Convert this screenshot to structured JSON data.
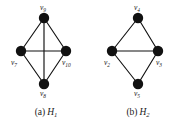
{
  "figure": {
    "background_color": "#ffffff",
    "vertex_color": "#111111",
    "edge_color": "#111111",
    "text_color": "#1a1a1a"
  },
  "panels": [
    {
      "id": "H1",
      "caption_tag": "(a)",
      "caption_name": "H",
      "caption_sub": "1",
      "vertices": [
        {
          "id": "v9",
          "label": "v",
          "sub": "9",
          "x": 44,
          "y": 18,
          "r": 5.2,
          "label_x": 40,
          "label_y": 4,
          "label_anchor": "top"
        },
        {
          "id": "v7",
          "label": "v",
          "sub": "7",
          "x": 21,
          "y": 51,
          "r": 5.2,
          "label_x": 11,
          "label_y": 59,
          "label_anchor": "bottom-left"
        },
        {
          "id": "v10",
          "label": "v",
          "sub": "10",
          "x": 66,
          "y": 51,
          "r": 5.2,
          "label_x": 62,
          "label_y": 59,
          "label_anchor": "bottom-right"
        },
        {
          "id": "v8",
          "label": "v",
          "sub": "8",
          "x": 44,
          "y": 84,
          "r": 5.2,
          "label_x": 40,
          "label_y": 90,
          "label_anchor": "bottom"
        }
      ],
      "edges": [
        {
          "from": "v9",
          "to": "v7",
          "name": "edge-v9-v7"
        },
        {
          "from": "v9",
          "to": "v10",
          "name": "edge-v9-v10"
        },
        {
          "from": "v7",
          "to": "v8",
          "name": "edge-v7-v8"
        },
        {
          "from": "v10",
          "to": "v8",
          "name": "edge-v10-v8"
        },
        {
          "from": "v7",
          "to": "v10",
          "name": "edge-v7-v10"
        },
        {
          "from": "v9",
          "to": "v8",
          "name": "edge-v9-v8"
        }
      ]
    },
    {
      "id": "H2",
      "caption_tag": "(b)",
      "caption_name": "H",
      "caption_sub": "2",
      "vertices": [
        {
          "id": "v4",
          "label": "v",
          "sub": "4",
          "x": 46,
          "y": 18,
          "r": 5.2,
          "label_x": 42,
          "label_y": 4,
          "label_anchor": "top"
        },
        {
          "id": "v2",
          "label": "v",
          "sub": "2",
          "x": 20,
          "y": 51,
          "r": 5.2,
          "label_x": 12,
          "label_y": 59,
          "label_anchor": "bottom-left"
        },
        {
          "id": "v3",
          "label": "v",
          "sub": "3",
          "x": 66,
          "y": 51,
          "r": 5.2,
          "label_x": 64,
          "label_y": 59,
          "label_anchor": "bottom-right"
        },
        {
          "id": "v5",
          "label": "v",
          "sub": "5",
          "x": 46,
          "y": 84,
          "r": 5.2,
          "label_x": 42,
          "label_y": 90,
          "label_anchor": "bottom"
        }
      ],
      "edges": [
        {
          "from": "v4",
          "to": "v2",
          "name": "edge-v4-v2"
        },
        {
          "from": "v4",
          "to": "v3",
          "name": "edge-v4-v3"
        },
        {
          "from": "v2",
          "to": "v5",
          "name": "edge-v2-v5"
        },
        {
          "from": "v3",
          "to": "v5",
          "name": "edge-v3-v5"
        },
        {
          "from": "v2",
          "to": "v3",
          "name": "edge-v2-v3"
        }
      ]
    }
  ]
}
